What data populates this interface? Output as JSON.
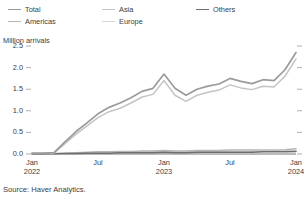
{
  "legend": {
    "items": [
      {
        "label": "Total",
        "color": "#9b9b9b"
      },
      {
        "label": "Americas",
        "color": "#b5b5b5"
      },
      {
        "label": "Asia",
        "color": "#c4c4c4"
      },
      {
        "label": "Europe",
        "color": "#d6d6d6"
      },
      {
        "label": "Others",
        "color": "#6e6e6e"
      }
    ]
  },
  "axis": {
    "y_title": "Million arrivals",
    "y_ticks": [
      "2.5",
      "2.0",
      "1.5",
      "1.0",
      "0.5",
      "0.0"
    ],
    "x_ticks": [
      {
        "month": "Jan",
        "year": "2022"
      },
      {
        "month": "Jul",
        "year": ""
      },
      {
        "month": "Jan",
        "year": "2023"
      },
      {
        "month": "Jul",
        "year": ""
      },
      {
        "month": "Jan",
        "year": "2024"
      }
    ]
  },
  "source": {
    "text": "Source: Haver Analytics."
  },
  "chart_data": {
    "type": "line",
    "title": "",
    "subtitle": "",
    "xlabel": "",
    "ylabel": "Million arrivals",
    "ylim": [
      0.0,
      2.5
    ],
    "ytick_values": [
      0.0,
      0.5,
      1.0,
      1.5,
      2.0,
      2.5
    ],
    "grid": false,
    "legend_position": "top-left",
    "x": [
      "Jan 2022",
      "Feb 2022",
      "Mar 2022",
      "Apr 2022",
      "May 2022",
      "Jun 2022",
      "Jul 2022",
      "Aug 2022",
      "Sep 2022",
      "Oct 2022",
      "Nov 2022",
      "Dec 2022",
      "Jan 2023",
      "Feb 2023",
      "Mar 2023",
      "Apr 2023",
      "May 2023",
      "Jun 2023",
      "Jul 2023",
      "Aug 2023",
      "Sep 2023",
      "Oct 2023",
      "Nov 2023",
      "Dec 2023",
      "Jan 2024"
    ],
    "xtick_labels": [
      "Jan 2022",
      "Jul",
      "Jan 2023",
      "Jul",
      "Jan 2024"
    ],
    "series": [
      {
        "name": "Total",
        "color": "#9b9b9b",
        "values": [
          0.02,
          0.02,
          0.03,
          0.28,
          0.52,
          0.72,
          0.93,
          1.08,
          1.18,
          1.3,
          1.45,
          1.52,
          1.85,
          1.52,
          1.36,
          1.5,
          1.57,
          1.62,
          1.75,
          1.68,
          1.63,
          1.72,
          1.7,
          1.95,
          2.35
        ]
      },
      {
        "name": "Asia",
        "color": "#c4c4c4",
        "values": [
          0.01,
          0.01,
          0.02,
          0.24,
          0.46,
          0.65,
          0.84,
          0.98,
          1.06,
          1.18,
          1.32,
          1.38,
          1.7,
          1.36,
          1.22,
          1.36,
          1.43,
          1.48,
          1.6,
          1.53,
          1.49,
          1.57,
          1.55,
          1.8,
          2.2
        ]
      },
      {
        "name": "Americas",
        "color": "#b5b5b5",
        "values": [
          0.005,
          0.005,
          0.008,
          0.02,
          0.03,
          0.04,
          0.05,
          0.05,
          0.06,
          0.06,
          0.07,
          0.07,
          0.08,
          0.07,
          0.07,
          0.08,
          0.08,
          0.08,
          0.09,
          0.09,
          0.09,
          0.09,
          0.09,
          0.1,
          0.12
        ]
      },
      {
        "name": "Europe",
        "color": "#d6d6d6",
        "values": [
          0.003,
          0.003,
          0.005,
          0.01,
          0.02,
          0.03,
          0.03,
          0.04,
          0.04,
          0.04,
          0.05,
          0.05,
          0.05,
          0.05,
          0.05,
          0.05,
          0.06,
          0.06,
          0.06,
          0.06,
          0.06,
          0.06,
          0.07,
          0.07,
          0.08
        ]
      },
      {
        "name": "Others",
        "color": "#6e6e6e",
        "values": [
          0.002,
          0.002,
          0.003,
          0.01,
          0.01,
          0.02,
          0.02,
          0.02,
          0.03,
          0.03,
          0.03,
          0.03,
          0.04,
          0.03,
          0.03,
          0.04,
          0.04,
          0.04,
          0.04,
          0.04,
          0.04,
          0.05,
          0.05,
          0.05,
          0.06
        ]
      }
    ]
  }
}
